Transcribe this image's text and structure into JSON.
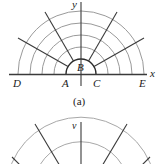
{
  "figure_a": {
    "caption": "(a)",
    "axis_labels": {
      "x": "x",
      "y": "y"
    },
    "point_labels": {
      "A": "A",
      "B": "B",
      "C": "C",
      "D": "D",
      "E": "E"
    },
    "center": [
      81,
      74
    ],
    "arc_radii": [
      15,
      27,
      39,
      51,
      63
    ],
    "radial_angles_deg": [
      30,
      60,
      120,
      150
    ],
    "colors": {
      "axis": "#3a3a3a",
      "arc": "#9a9a9a",
      "radial": "#3a3a3a"
    }
  },
  "figure_b": {
    "axis_labels": {
      "y": "v"
    },
    "partial": true,
    "colors": {
      "axis": "#3a3a3a",
      "arc": "#a8a8a8",
      "radial": "#3a3a3a"
    }
  }
}
